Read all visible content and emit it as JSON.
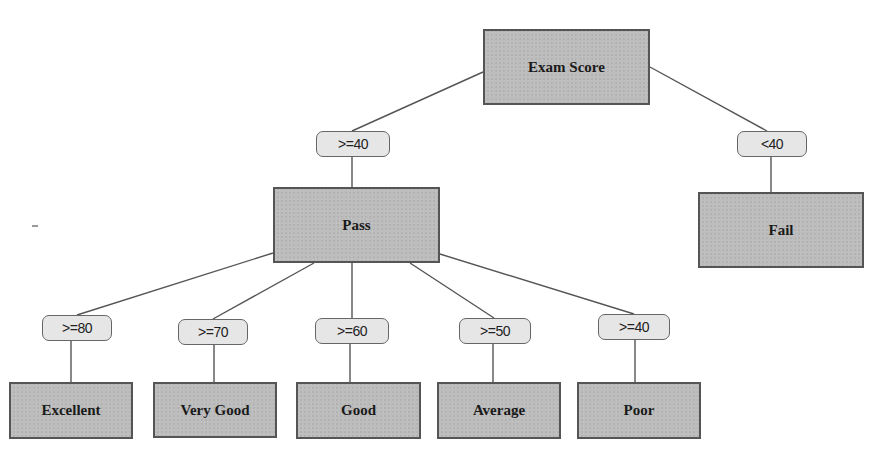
{
  "diagram": {
    "type": "decision-tree",
    "root": {
      "label": "Exam Score",
      "box": [
        483,
        29,
        167,
        76
      ]
    },
    "level1": {
      "conditions": [
        {
          "label": ">=40",
          "box": [
            316,
            131,
            74,
            26
          ]
        },
        {
          "label": "<40",
          "box": [
            737,
            131,
            70,
            26
          ]
        }
      ],
      "outcomes": [
        {
          "label": "Pass",
          "box": [
            273,
            187,
            167,
            76
          ]
        },
        {
          "label": "Fail",
          "box": [
            698,
            192,
            166,
            76
          ]
        }
      ]
    },
    "level2": {
      "conditions": [
        {
          "label": ">=80",
          "box": [
            42,
            315,
            70,
            26
          ]
        },
        {
          "label": ">=70",
          "box": [
            178,
            319,
            70,
            26
          ]
        },
        {
          "label": ">=60",
          "box": [
            315,
            318,
            74,
            26
          ]
        },
        {
          "label": ">=50",
          "box": [
            459,
            318,
            72,
            26
          ]
        },
        {
          "label": ">=40",
          "box": [
            598,
            314,
            72,
            26
          ]
        }
      ],
      "outcomes": [
        {
          "label": "Excellent",
          "box": [
            9,
            382,
            124,
            57
          ]
        },
        {
          "label": "Very Good",
          "box": [
            153,
            382,
            124,
            56
          ]
        },
        {
          "label": "Good",
          "box": [
            296,
            382,
            125,
            57
          ]
        },
        {
          "label": "Average",
          "box": [
            437,
            382,
            124,
            57
          ]
        },
        {
          "label": "Poor",
          "box": [
            577,
            382,
            124,
            57
          ]
        }
      ]
    },
    "edges": [
      {
        "from": "Exam Score",
        "to": ">=40 (Pass)",
        "points": [
          483,
          72,
          352,
          131
        ]
      },
      {
        "from": "Exam Score",
        "to": "<40 (Fail)",
        "points": [
          650,
          67,
          767,
          131
        ]
      },
      {
        "from": ">=40 (Pass)",
        "to": "Pass",
        "points": [
          352,
          157,
          352,
          187
        ]
      },
      {
        "from": "<40 (Fail)",
        "to": "Fail",
        "points": [
          771,
          157,
          771,
          192
        ]
      },
      {
        "from": "Pass",
        "to": ">=80",
        "points": [
          273,
          253,
          77,
          315
        ]
      },
      {
        "from": "Pass",
        "to": ">=70",
        "points": [
          314,
          263,
          213,
          319
        ]
      },
      {
        "from": "Pass",
        "to": ">=60",
        "points": [
          352,
          263,
          352,
          318
        ]
      },
      {
        "from": "Pass",
        "to": ">=50",
        "points": [
          410,
          263,
          494,
          318
        ]
      },
      {
        "from": "Pass",
        "to": ">=40",
        "points": [
          440,
          254,
          634,
          314
        ]
      },
      {
        "from": ">=80",
        "to": "Excellent",
        "points": [
          71,
          341,
          71,
          382
        ]
      },
      {
        "from": ">=70",
        "to": "Very Good",
        "points": [
          214,
          345,
          214,
          382
        ]
      },
      {
        "from": ">=60",
        "to": "Good",
        "points": [
          350,
          344,
          350,
          382
        ]
      },
      {
        "from": ">=50",
        "to": "Average",
        "points": [
          493,
          344,
          493,
          382
        ]
      },
      {
        "from": ">=40",
        "to": "Poor",
        "points": [
          635,
          340,
          635,
          382
        ]
      }
    ],
    "colors": {
      "node_fill": "#bdbdbd",
      "node_border": "#555555",
      "pill_fill": "#e6e6e6",
      "pill_border": "#666666",
      "edge": "#555555",
      "text": "#1a1a1a"
    }
  }
}
